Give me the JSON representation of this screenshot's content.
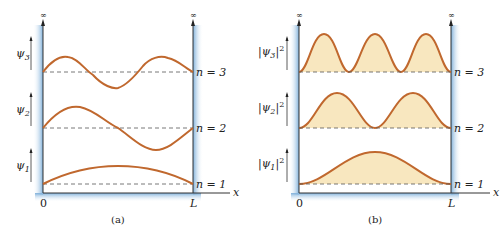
{
  "figure": {
    "panels": [
      {
        "id": "a",
        "caption": "(a)",
        "top_symbol": "∞",
        "origin_label": "0",
        "end_label": "L",
        "axis_label": "x",
        "levels": [
          {
            "n_label": "n = 3",
            "y_label": "ψ3",
            "sub": "3"
          },
          {
            "n_label": "n = 2",
            "y_label": "ψ2",
            "sub": "2"
          },
          {
            "n_label": "n = 1",
            "y_label": "ψ1",
            "sub": "1"
          }
        ]
      },
      {
        "id": "b",
        "caption": "(b)",
        "top_symbol": "∞",
        "origin_label": "0",
        "end_label": "L",
        "axis_label": "x",
        "levels": [
          {
            "n_label": "n = 3",
            "y_label": "|ψ3|²",
            "sub": "3"
          },
          {
            "n_label": "n = 2",
            "y_label": "|ψ2|²",
            "sub": "2"
          },
          {
            "n_label": "n = 1",
            "y_label": "|ψ1|²",
            "sub": "1"
          }
        ]
      }
    ],
    "colors": {
      "wall": "#a9cbe6",
      "curve": "#c0682e",
      "fill": "#f8e7bf",
      "axis": "#333333"
    }
  }
}
